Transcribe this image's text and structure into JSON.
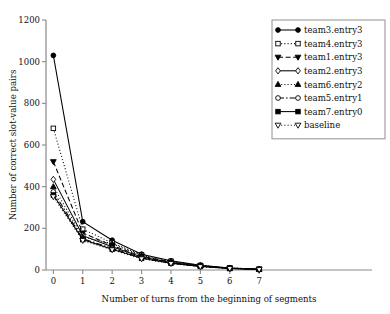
{
  "chart_data": {
    "type": "line",
    "title": "",
    "xlabel": "Number of turns from the beginning of segments",
    "ylabel": "Number of correct slot-value pairs",
    "x": [
      0,
      1,
      2,
      3,
      4,
      5,
      6,
      7
    ],
    "xlim": [
      -0.25,
      7.3
    ],
    "ylim": [
      0,
      1200
    ],
    "xticks": [
      "0",
      "1",
      "2",
      "3",
      "4",
      "5",
      "6",
      "7"
    ],
    "yticks": [
      "0",
      "200",
      "400",
      "600",
      "800",
      "1000",
      "1200"
    ],
    "ytick_values": [
      0,
      200,
      400,
      600,
      800,
      1000,
      1200
    ],
    "grid": false,
    "legend_position": "upper right",
    "series": [
      {
        "name": "team3.entry3",
        "values": [
          1030,
          232,
          143,
          76,
          44,
          23,
          10,
          4
        ],
        "marker": "circle-filled",
        "dash": "none",
        "color": "#000000"
      },
      {
        "name": "team4.entry3",
        "values": [
          680,
          196,
          130,
          72,
          42,
          22,
          10,
          4
        ],
        "marker": "square-open",
        "dash": "dotted",
        "color": "#000000"
      },
      {
        "name": "team1.entry3",
        "values": [
          520,
          178,
          118,
          66,
          38,
          20,
          9,
          3
        ],
        "marker": "triangle-down-filled",
        "dash": "dashed",
        "color": "#000000"
      },
      {
        "name": "team2.entry3",
        "values": [
          435,
          165,
          112,
          62,
          36,
          19,
          8,
          3
        ],
        "marker": "diamond-open",
        "dash": "none",
        "color": "#000000"
      },
      {
        "name": "team6.entry2",
        "values": [
          400,
          158,
          126,
          70,
          40,
          21,
          9,
          3
        ],
        "marker": "triangle-up-filled",
        "dash": "dotted",
        "color": "#000000"
      },
      {
        "name": "team5.entry1",
        "values": [
          375,
          150,
          104,
          58,
          33,
          17,
          8,
          3
        ],
        "marker": "circle-open",
        "dash": "dashdot",
        "color": "#000000"
      },
      {
        "name": "team7.entry0",
        "values": [
          360,
          146,
          100,
          56,
          32,
          17,
          7,
          3
        ],
        "marker": "square-filled",
        "dash": "none",
        "color": "#000000"
      },
      {
        "name": "baseline",
        "values": [
          352,
          142,
          97,
          54,
          31,
          16,
          7,
          2
        ],
        "marker": "triangle-down-open",
        "dash": "dotted",
        "color": "#000000"
      }
    ]
  }
}
